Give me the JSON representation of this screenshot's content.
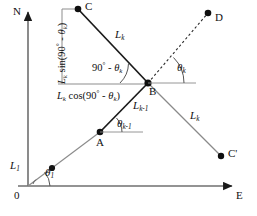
{
  "figure": {
    "type": "geometry-diagram",
    "background": "#ffffff",
    "line_color": "#1a1a1a",
    "thin_line_color": "#7a7a7a",
    "text_color": "#111111"
  },
  "axes": {
    "north_label": "N",
    "east_label": "E",
    "origin_label": "0"
  },
  "points": {
    "origin": "0",
    "a": "A",
    "b": "B",
    "c": "C",
    "c_prime": "C'",
    "d": "D"
  },
  "segments": {
    "first_leg": "L",
    "first_leg_sub": "1",
    "prev_leg": "L",
    "prev_leg_sub": "k-1",
    "leg_k_upper": "L",
    "leg_k_upper_sub": "k",
    "leg_k_lower": "L",
    "leg_k_lower_sub": "k"
  },
  "angles": {
    "theta_1": "θ",
    "theta_1_sub": "1",
    "theta_k_minus_1": "θ",
    "theta_k_minus_1_sub": "k-1",
    "theta_k": "θ",
    "theta_k_sub": "k",
    "complement": "90",
    "complement_deg": "°",
    "complement_minus": " - θ",
    "complement_sub": "k"
  },
  "components": {
    "vertical_prefix": "L",
    "vertical_sub": "k",
    "vertical_fn": " sin(90",
    "vertical_deg": "°",
    "vertical_tail": " - θ",
    "vertical_tail_sub": "k",
    "vertical_close": ")",
    "horizontal_prefix": "L",
    "horizontal_sub": "k",
    "horizontal_fn": " cos(90",
    "horizontal_deg": "°",
    "horizontal_tail": " - θ",
    "horizontal_tail_sub": "k",
    "horizontal_close": ")"
  }
}
